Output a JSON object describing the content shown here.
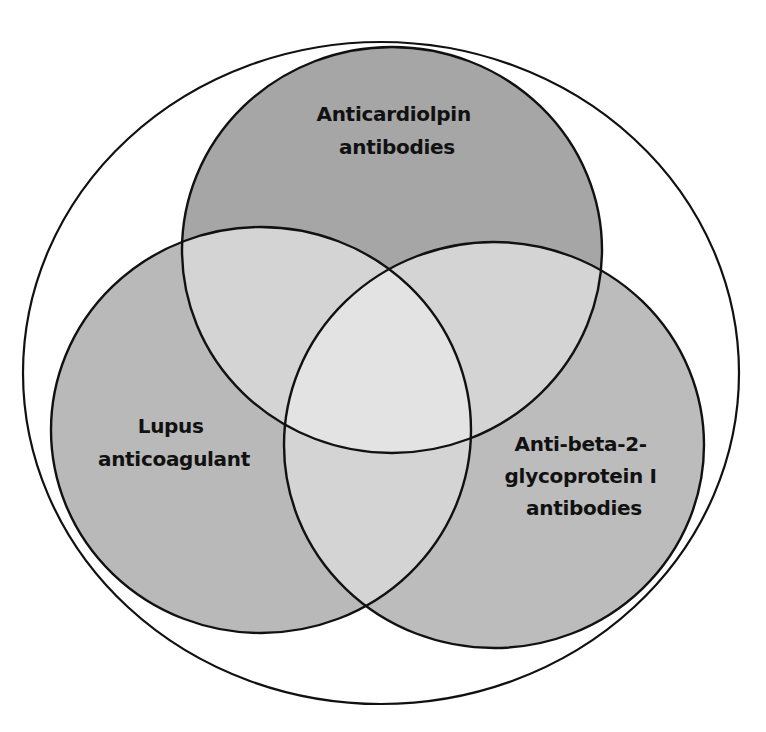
{
  "diagram": {
    "type": "venn",
    "title_cropped": true,
    "universe": {
      "shape": "ellipse",
      "cx": 381,
      "cy": 373,
      "rx": 358,
      "ry": 331
    },
    "sets": [
      {
        "id": "acl",
        "label_lines": [
          "Anticardiolpin",
          "antibodies"
        ],
        "cx": 392,
        "cy": 250,
        "rx": 210,
        "ry": 203,
        "fill": "#a6a6a6",
        "label_x": 397,
        "label_y": [
          121,
          154
        ]
      },
      {
        "id": "la",
        "label_lines": [
          "Lupus",
          "anticoagulant"
        ],
        "cx": 261,
        "cy": 430,
        "rx": 210,
        "ry": 203,
        "fill": "#b9b9b9",
        "label_x": 174,
        "label_y": [
          433,
          466
        ]
      },
      {
        "id": "b2gp1",
        "label_lines": [
          "Anti-beta-2-",
          "glycoprotein I",
          "antibodies"
        ],
        "cx": 494,
        "cy": 445,
        "rx": 210,
        "ry": 203,
        "fill": "#bcbcbc",
        "label_x": 584,
        "label_y": [
          451,
          483,
          515
        ]
      }
    ],
    "overlap_colors": {
      "pairwise": "#d4d4d4",
      "center": "#e3e3e3"
    },
    "outline_color": "#111111",
    "background": "#ffffff"
  }
}
